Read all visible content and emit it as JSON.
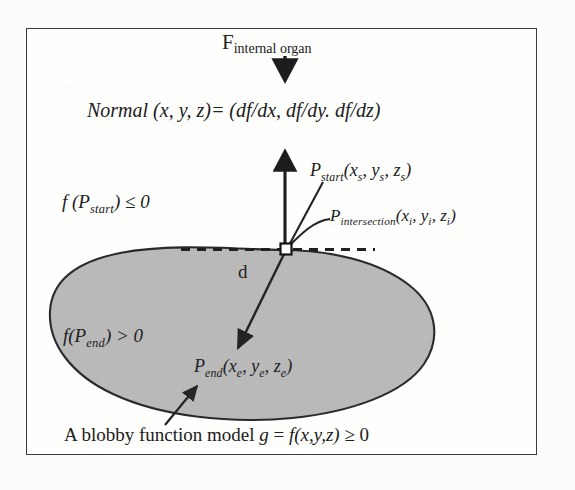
{
  "figure": {
    "type": "geometric-diagram",
    "frame": {
      "border_color": "#3a3a3a",
      "background_color": "#ffffff"
    },
    "blob": {
      "name": "blobby-organ-shape",
      "fill_color": "#b8b8b8",
      "stroke_color": "#2b2b2b"
    }
  },
  "labels": {
    "force": {
      "base": "F",
      "subscript": "internal organ",
      "full": "F internal organ"
    },
    "normal_equation": {
      "full": "Normal (x, y, z)= (df/dx, df/dy. df/dz)",
      "lhs": "Normal (x, y, z)",
      "equals": "= ",
      "rhs": "(df/dx, df/dy. df/dz)"
    },
    "p_start": {
      "base": "P",
      "subscript": "start",
      "coords": "(x",
      "coord_sub_1": "s",
      "coord_mid_1": ", y",
      "coord_sub_2": "s",
      "coord_mid_2": ", z",
      "coord_sub_3": "s",
      "coord_close": ")",
      "full": "P start (x s , y s , z s )"
    },
    "f_p_start": {
      "base": "f (P",
      "subscript": "start",
      "tail": ") ≤ 0",
      "full": "f (P start ) ≤ 0"
    },
    "p_intersection": {
      "base": "P",
      "subscript": "intersection",
      "coords": "(x",
      "coord_sub_1": "i",
      "coord_mid_1": ", y",
      "coord_sub_2": "i",
      "coord_mid_2": ", z",
      "coord_sub_3": "i",
      "coord_close": ")",
      "full": "P intersection (x i , y i , z i )"
    },
    "distance": {
      "text": "d"
    },
    "f_p_end": {
      "base": "f(P",
      "subscript": "end",
      "tail": ") > 0",
      "full": "f(P end ) > 0"
    },
    "p_end": {
      "base": "P",
      "subscript": "end",
      "coords": "(x",
      "coord_sub_1": "e",
      "coord_mid_1": ", y",
      "coord_sub_2": "e",
      "coord_mid_2": ", z",
      "coord_sub_3": "e",
      "coord_close": ")",
      "full": "P end (x e , y e , z e )"
    },
    "caption": {
      "lead": "A blobby function model ",
      "g": "g",
      "equals": " = ",
      "func": "f(x,y,z)",
      "tail": " ≥ 0",
      "full": "A blobby function model g = f(x,y,z) ≥ 0"
    }
  },
  "arrows": {
    "force_arrow": {
      "direction": "down",
      "name": "force-arrow"
    },
    "normal_arrow": {
      "direction": "up",
      "name": "normal-vector-arrow"
    },
    "ray_arrow": {
      "direction": "down-left-into-blob",
      "name": "ray-arrow"
    },
    "pstart_leader": {
      "name": "p-start-leader-line"
    },
    "pintersection_leader": {
      "name": "p-intersection-leader-line"
    },
    "caption_leader": {
      "name": "caption-leader-arrow"
    },
    "tangent_dashed": {
      "name": "tangent-dashed-line",
      "style": "dashed"
    }
  }
}
